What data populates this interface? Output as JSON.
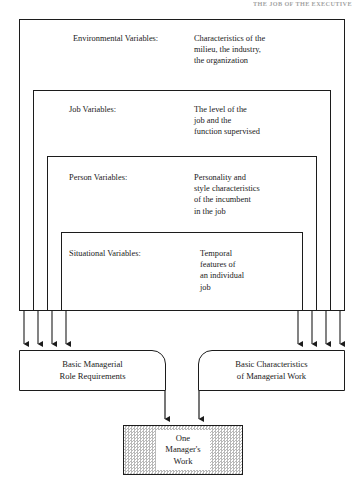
{
  "page": {
    "running_head": "THE JOB OF THE EXECUTIVE",
    "background": "#ffffff",
    "line_color": "#1c1c1c",
    "shade_color": "#b9b9b9"
  },
  "diagram": {
    "type": "nested-frames-flow",
    "frames": [
      {
        "label": "Environmental Variables:",
        "description": "Characteristics of the\nmilieu, the industry,\nthe organization",
        "description_lines": [
          "Characteristics of the",
          "milieu, the industry,",
          "the organization"
        ],
        "level": 1
      },
      {
        "label": "Job Variables:",
        "description": "The level of the\njob and the\nfunction supervised",
        "description_lines": [
          "The level of the",
          "job and the",
          "function supervised"
        ],
        "level": 2
      },
      {
        "label": "Person Variables:",
        "description": "Personality and\nstyle characteristics\nof the incumbent\nin the job",
        "description_lines": [
          "Personality and",
          "style characteristics",
          "of the incumbent",
          "in the job"
        ],
        "level": 3
      },
      {
        "label": "Situational Variables:",
        "description": "Temporal\nfeatures of\nan individual\njob",
        "description_lines": [
          "Temporal",
          "features of",
          "an individual",
          "job"
        ],
        "level": 4
      }
    ],
    "arrow_groups": [
      {
        "side": "left",
        "count": 4
      },
      {
        "side": "right",
        "count": 4
      }
    ],
    "outputs": [
      {
        "id": "role-requirements",
        "lines": [
          "Basic Managerial",
          "Role Requirements"
        ],
        "text": "Basic Managerial Role Requirements"
      },
      {
        "id": "characteristics-of-work",
        "lines": [
          "Basic Characteristics",
          "of Managerial Work"
        ],
        "text": "Basic Characteristics of Managerial Work"
      }
    ],
    "final": {
      "id": "one-managers-work",
      "lines": [
        "One",
        "Manager's",
        "Work"
      ],
      "text": "One Manager's Work",
      "fill": "screened-gray"
    }
  }
}
